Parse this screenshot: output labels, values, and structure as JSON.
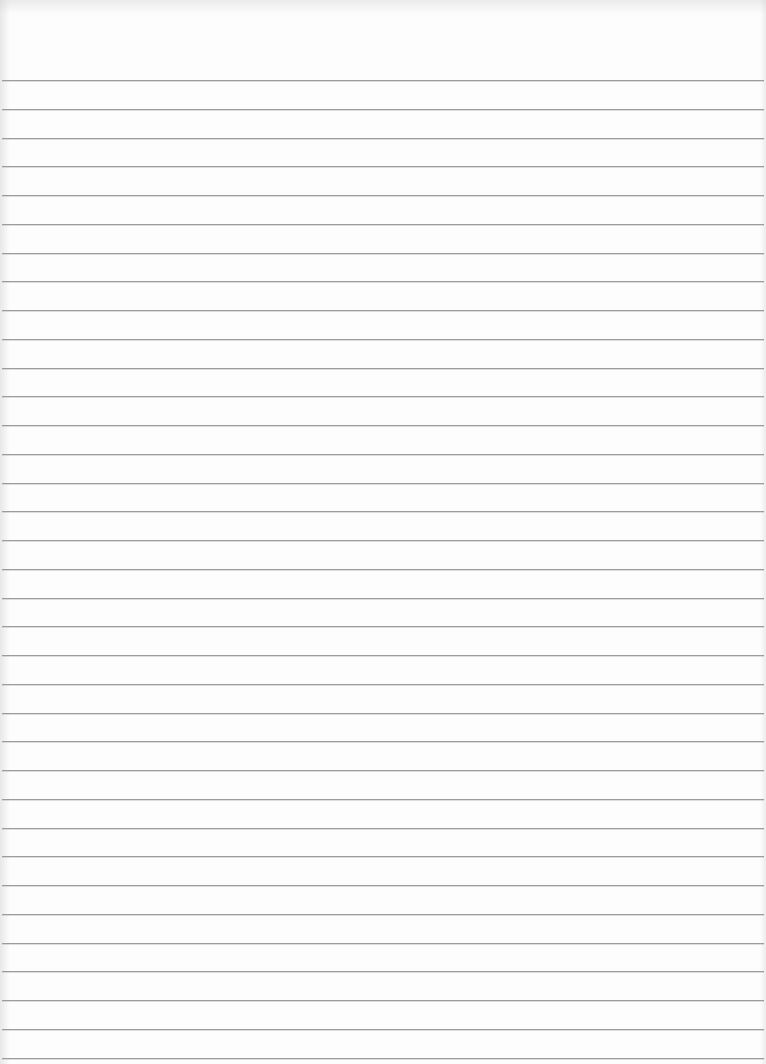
{
  "document": {
    "type": "ruled-paper",
    "content_text": "",
    "line_color": "#9c9c9c",
    "paper_color": "#fdfdfd",
    "line_count": 35,
    "first_line_y": 80,
    "line_spacing": 28.75
  }
}
